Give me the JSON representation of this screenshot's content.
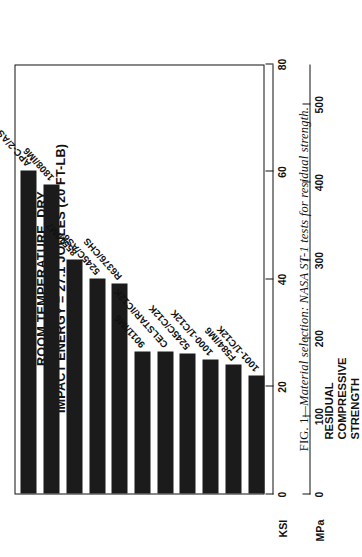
{
  "figure": {
    "caption_number": "FIG. 1",
    "caption_dash": "—",
    "caption_text": "Material selection: NASA ST-1 tests for residual strength."
  },
  "chart_data": {
    "type": "bar",
    "orientation": "horizontal",
    "title": "",
    "annotations": [
      "ROOM TEMPERATURE, DRY",
      "IMPACT ENERGY = 27.1 JOULES (20 FT-LB)"
    ],
    "categories": [
      "APC-2/AS4",
      "1808/IM6",
      "8551/IM7",
      "5245C/AS6",
      "R6376/CHS",
      "9011/IM6",
      "CELSTAR/IC12K",
      "5245C/C12K",
      "1000-1/C12K",
      "F584/IM6",
      "1001-1/C12K"
    ],
    "values": [
      60,
      57.5,
      43.5,
      40,
      39,
      26.5,
      26.5,
      26,
      25,
      24,
      22
    ],
    "value_unit": "KSI",
    "xlabel": "",
    "ylabel": "RESIDUAL COMPRESSIVE STRENGTH",
    "ylabel_lines": [
      "RESIDUAL",
      "COMPRESSIVE",
      "STRENGTH"
    ],
    "axes": [
      {
        "name": "KSI",
        "unit_label": "KSI",
        "ticks": [
          80,
          60,
          40,
          20,
          0
        ],
        "range": [
          0,
          80
        ]
      },
      {
        "name": "MPa",
        "unit_label": "MPa",
        "ticks": [
          500,
          400,
          300,
          200,
          100,
          0
        ],
        "range": [
          0,
          551.6
        ]
      }
    ],
    "grid": false,
    "legend": "none",
    "bar_color": "#1b1b1b"
  }
}
